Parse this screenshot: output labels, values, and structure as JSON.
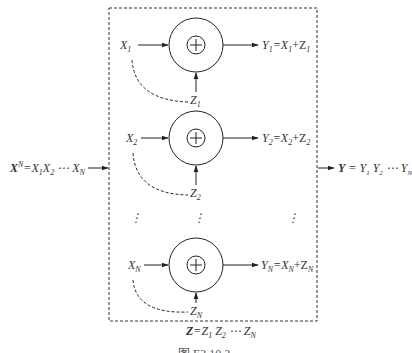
{
  "diagram": {
    "type": "parallel additive noise channel block diagram",
    "input_label": {
      "main": "X",
      "sup": "N",
      "rest": "=X",
      "parts": [
        "X",
        "N",
        "=X",
        "1",
        "X",
        "2",
        " ⋯ X",
        "N"
      ]
    },
    "output_label": {
      "parts": [
        "Y",
        " = Y",
        "1",
        " Y",
        "2",
        " ⋯  Y",
        "N"
      ]
    },
    "noise_label": {
      "parts": [
        "Z",
        "=Z",
        "1",
        " Z",
        "2",
        " ⋯ Z",
        "N"
      ]
    },
    "branches": [
      {
        "x": "X",
        "x_sub": "1",
        "z": "Z",
        "z_sub": "1",
        "y_eq": [
          "Y",
          "1",
          "=X",
          "1",
          "+Z",
          "1"
        ],
        "cy": 45
      },
      {
        "x": "X",
        "x_sub": "2",
        "z": "Z",
        "z_sub": "2",
        "y_eq": [
          "Y",
          "2",
          "=X",
          "2",
          "+Z",
          "2"
        ],
        "cy": 138
      },
      {
        "x": "X",
        "x_sub": "N",
        "z": "Z",
        "z_sub": "N",
        "y_eq": [
          "Y",
          "N",
          "=X",
          "N",
          "+Z",
          "N"
        ],
        "cy": 265
      }
    ],
    "adder_symbol": "+",
    "ellipsis_vertical": "⋮",
    "caption": "图 E3.10.2",
    "colors": {
      "line": "#222222",
      "text": "#333333",
      "background": "#ffffff"
    }
  }
}
